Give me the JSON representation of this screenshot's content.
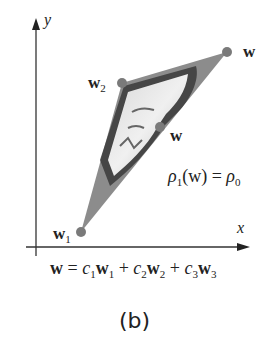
{
  "figure": {
    "caption": "(b)",
    "axes": {
      "x_label": "x",
      "y_label": "y"
    },
    "points": {
      "w1": {
        "label": "w",
        "sub": "1"
      },
      "w2": {
        "label": "w",
        "sub": "2"
      },
      "w3": {
        "label": "w",
        "sub": ""
      },
      "w": {
        "label": "w"
      }
    },
    "equation_right": {
      "rho": "ρ",
      "sub1": "1",
      "arg": "(w) = ",
      "rho0": "ρ",
      "sub0": "0"
    },
    "equation_bottom": {
      "lhs": "w",
      "eq": " = ",
      "terms": [
        {
          "c": "c",
          "csub": "1",
          "w": "w",
          "wsub": "1",
          "op": " + "
        },
        {
          "c": "c",
          "csub": "2",
          "w": "w",
          "wsub": "2",
          "op": " + "
        },
        {
          "c": "c",
          "csub": "3",
          "w": "w",
          "wsub": "3",
          "op": ""
        }
      ]
    },
    "colors": {
      "triangle": "#8c8c8c",
      "point": "#7a7a7a",
      "axis": "#333333"
    }
  }
}
